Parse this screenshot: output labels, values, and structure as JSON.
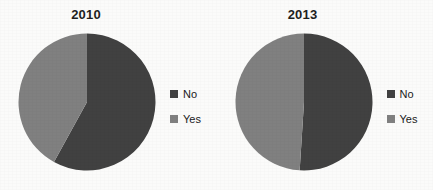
{
  "figure": {
    "background_color": "#fbfbfa",
    "panels": [
      {
        "title": "2010",
        "legend": [
          {
            "label": "No",
            "color": "#414141"
          },
          {
            "label": "Yes",
            "color": "#808080"
          }
        ]
      },
      {
        "title": "2013",
        "legend": [
          {
            "label": "No",
            "color": "#414141"
          },
          {
            "label": "Yes",
            "color": "#808080"
          }
        ]
      }
    ]
  },
  "chart_data": [
    {
      "type": "pie",
      "title": "2010",
      "categories": [
        "No",
        "Yes"
      ],
      "values": [
        58,
        42
      ],
      "unit": "percent",
      "colors": [
        "#414141",
        "#808080"
      ],
      "start_angle_deg": 0,
      "direction": "clockwise",
      "legend_position": "right",
      "data_labels": false,
      "xlabel": "",
      "ylabel": ""
    },
    {
      "type": "pie",
      "title": "2013",
      "categories": [
        "No",
        "Yes"
      ],
      "values": [
        51,
        49
      ],
      "unit": "percent",
      "colors": [
        "#414141",
        "#808080"
      ],
      "start_angle_deg": 0,
      "direction": "clockwise",
      "legend_position": "right",
      "data_labels": false,
      "xlabel": "",
      "ylabel": ""
    }
  ]
}
